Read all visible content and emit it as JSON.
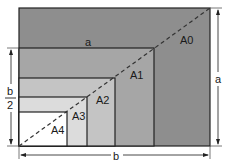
{
  "diagram": {
    "title": "",
    "sheets": [
      {
        "label": "A0",
        "color": "#8e8e8e"
      },
      {
        "label": "A1",
        "color": "#a6a6a6"
      },
      {
        "label": "A2",
        "color": "#c4c4c4"
      },
      {
        "label": "A3",
        "color": "#dcdcdc"
      },
      {
        "label": "A4",
        "color": "#ffffff"
      }
    ],
    "dimensions": {
      "top_width_label": "a",
      "right_height_label": "a",
      "bottom_width_label": "b",
      "left_half_numerator": "b",
      "left_half_denominator": "2"
    }
  }
}
